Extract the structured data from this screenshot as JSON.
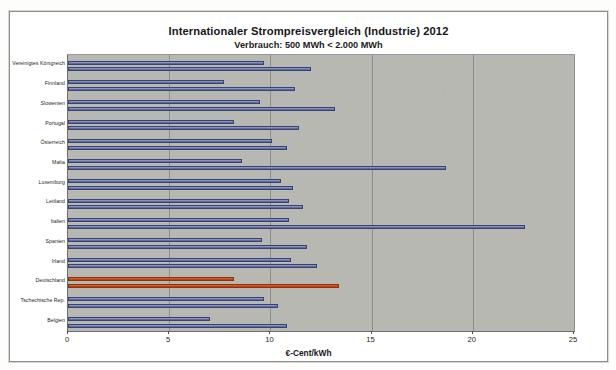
{
  "chart_data": {
    "type": "bar",
    "orientation": "horizontal",
    "title": "Internationaler Strompreisvergleich (Industrie) 2012",
    "subtitle": "Verbrauch: 500 MWh < 2.000 MWh",
    "xlabel": "€-Cent/kWh",
    "ylabel": "",
    "xlim": [
      0,
      25
    ],
    "xticks": [
      0,
      5,
      10,
      15,
      20,
      25
    ],
    "xtick_labels": [
      "0",
      "5",
      "10",
      "15",
      "20",
      "25"
    ],
    "grid": true,
    "legend": false,
    "plot_bgcolor": "#b7b8b2",
    "bar_color": "#6d78ab",
    "highlight_color": "#d2511d",
    "highlight_category": "Deutschland",
    "categories": [
      "Vereinigtes Königreich",
      "Finnland",
      "Slowenien",
      "Portugal",
      "Österreich",
      "Malta",
      "Luxemburg",
      "Lettland",
      "Italien",
      "Spanien",
      "Irland",
      "Deutschland",
      "Tschechische Rep.",
      "Belgien"
    ],
    "series": [
      {
        "name": "Wert A",
        "values": [
          9.7,
          7.7,
          9.5,
          8.2,
          10.1,
          8.6,
          10.5,
          10.9,
          10.9,
          9.6,
          11.0,
          8.2,
          9.7,
          7.0
        ]
      },
      {
        "name": "Wert B",
        "values": [
          12.0,
          11.2,
          13.2,
          11.4,
          10.8,
          18.7,
          11.1,
          11.6,
          22.6,
          11.8,
          12.3,
          13.4,
          10.4,
          10.8
        ]
      }
    ]
  }
}
